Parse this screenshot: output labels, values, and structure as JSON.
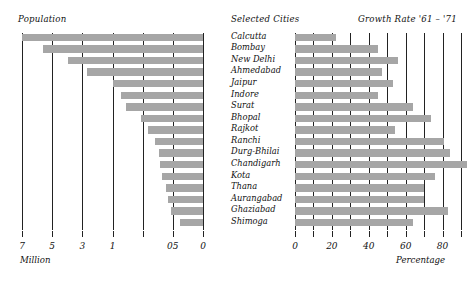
{
  "headers": {
    "population": "Population",
    "cities": "Selected Cities",
    "growth": "Growth Rate '61 – '71"
  },
  "axis_captions": {
    "left": "Million",
    "right": "Percentage"
  },
  "chart_data": {
    "type": "bar",
    "orientation": "horizontal",
    "categories": [
      "Calcutta",
      "Bombay",
      "New Delhi",
      "Ahmedabad",
      "Jaipur",
      "Indore",
      "Surat",
      "Bhopal",
      "Rajkot",
      "Ranchi",
      "Durg-Bhilai",
      "Chandigarh",
      "Kota",
      "Thana",
      "Aurangabad",
      "Ghaziabad",
      "Shimoga"
    ],
    "panels": [
      {
        "name": "population",
        "title": "Population",
        "xlabel": "Million",
        "direction": "rightToLeft",
        "axis_note": "reversed, non-linear (log-like) scale; bars grow leftward from 0",
        "ticks": [
          {
            "position": 0.0,
            "label": "7"
          },
          {
            "position": 0.166667,
            "label": "5"
          },
          {
            "position": 0.333333,
            "label": "3"
          },
          {
            "position": 0.5,
            "label": "1"
          },
          {
            "position": 0.666667,
            "label": ""
          },
          {
            "position": 0.833333,
            "label": "05"
          },
          {
            "position": 1.0,
            "label": "0"
          }
        ],
        "grid": true,
        "values": [
          7.0,
          6.0,
          3.6,
          2.0,
          0.64,
          0.56,
          0.49,
          0.38,
          0.31,
          0.26,
          0.23,
          0.22,
          0.21,
          0.18,
          0.17,
          0.15,
          0.1
        ],
        "bar_fractions": [
          1.0,
          0.885,
          0.745,
          0.64,
          0.5,
          0.455,
          0.425,
          0.345,
          0.305,
          0.265,
          0.245,
          0.235,
          0.225,
          0.205,
          0.195,
          0.175,
          0.125
        ]
      },
      {
        "name": "growth_rate",
        "title": "Growth Rate '61 – '71",
        "xlabel": "Percentage",
        "direction": "leftToRight",
        "xlim": [
          0,
          90
        ],
        "ticks": [
          {
            "position": 0,
            "label": "0"
          },
          {
            "position": 10,
            "label": ""
          },
          {
            "position": 20,
            "label": "20"
          },
          {
            "position": 30,
            "label": ""
          },
          {
            "position": 40,
            "label": "40"
          },
          {
            "position": 50,
            "label": ""
          },
          {
            "position": 60,
            "label": "60"
          },
          {
            "position": 70,
            "label": ""
          },
          {
            "position": 80,
            "label": "80"
          },
          {
            "position": 90,
            "label": ""
          }
        ],
        "grid": true,
        "values": [
          22,
          45,
          56,
          47,
          53,
          45,
          64,
          74,
          54,
          81,
          84,
          93,
          76,
          70,
          70,
          83,
          64
        ]
      }
    ],
    "colors": {
      "bar": "#a6a6a6",
      "gridline": "#222222",
      "text": "#111111",
      "background": "#ffffff"
    }
  }
}
